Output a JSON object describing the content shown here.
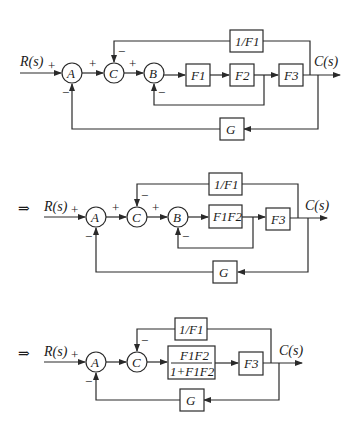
{
  "colors": {
    "line": "#2a2a2a",
    "background": "#ffffff"
  },
  "implies_symbol": "⇒",
  "signs": {
    "plus": "+",
    "minus": "−"
  },
  "diagrams": [
    {
      "id": "original",
      "input_label": "R(s)",
      "output_label": "C(s)",
      "summing_junctions": [
        "A",
        "C",
        "B"
      ],
      "blocks": {
        "f1": "F1",
        "f2": "F2",
        "f3": "F3",
        "inv_f1": "1/F1",
        "g": "G"
      }
    },
    {
      "id": "step-1",
      "prefix": "⇒",
      "input_label": "R(s)",
      "output_label": "C(s)",
      "summing_junctions": [
        "A",
        "C",
        "B"
      ],
      "blocks": {
        "f1f2": "F1F2",
        "f3": "F3",
        "inv_f1": "1/F1",
        "g": "G"
      }
    },
    {
      "id": "step-2",
      "prefix": "⇒",
      "input_label": "R(s)",
      "output_label": "C(s)",
      "summing_junctions": [
        "A",
        "C"
      ],
      "blocks": {
        "closed_loop_num": "F1F2",
        "closed_loop_den": "1+F1F2",
        "f3": "F3",
        "inv_f1": "1/F1",
        "g": "G"
      }
    }
  ]
}
